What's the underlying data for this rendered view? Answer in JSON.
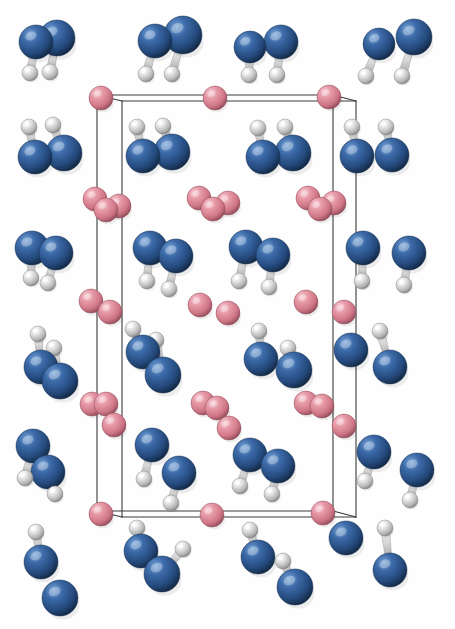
{
  "figure": {
    "kind": "crystal-structure-render",
    "background_color": "#fefefe",
    "width": 455,
    "height": 629,
    "caption": ""
  },
  "palette": {
    "atom_blue_base": "#2b5896",
    "atom_blue_light": "#5f8ec9",
    "atom_blue_dark": "#16304f",
    "atom_pink_base": "#e08795",
    "atom_pink_light": "#f4bcc5",
    "atom_pink_dark": "#9b5260",
    "atom_white_base": "#d8d8d8",
    "atom_white_light": "#ffffff",
    "atom_white_dark": "#8a8a8a",
    "bond_color": "#c9c9c9",
    "bond_edge_color": "#8d8d8d",
    "cell_edge_color": "#3a3a3a"
  },
  "legend": {
    "blue_label": "N",
    "pink_label": "O",
    "white_label": "H"
  },
  "unit_cell": {
    "label": "unit-cell",
    "stroke_width": 1.1,
    "front": {
      "x1": 122,
      "y1": 101,
      "x2": 356,
      "y2": 101,
      "x3": 356,
      "y3": 517,
      "x4": 122,
      "y4": 517
    },
    "back": {
      "x1": 97,
      "y1": 95,
      "x2": 333,
      "y2": 95,
      "x3": 333,
      "y3": 511,
      "x4": 97,
      "y4": 511
    },
    "edges": [
      [
        97,
        95,
        333,
        95
      ],
      [
        122,
        101,
        356,
        101
      ],
      [
        97,
        95,
        122,
        101
      ],
      [
        333,
        95,
        356,
        101
      ],
      [
        97,
        95,
        97,
        511
      ],
      [
        122,
        101,
        122,
        517
      ],
      [
        333,
        95,
        333,
        511
      ],
      [
        356,
        101,
        356,
        517
      ],
      [
        97,
        511,
        333,
        511
      ],
      [
        122,
        517,
        356,
        517
      ],
      [
        97,
        511,
        122,
        517
      ],
      [
        333,
        511,
        356,
        517
      ]
    ]
  },
  "atoms": [
    {
      "id": "n1",
      "type": "blue",
      "cx": 36,
      "cy": 42,
      "r": 17
    },
    {
      "id": "n2",
      "type": "blue",
      "cx": 57,
      "cy": 38,
      "r": 18
    },
    {
      "id": "h1",
      "type": "white",
      "cx": 30,
      "cy": 73,
      "r": 8
    },
    {
      "id": "h2",
      "type": "white",
      "cx": 50,
      "cy": 72,
      "r": 8
    },
    {
      "id": "n3",
      "type": "blue",
      "cx": 155,
      "cy": 41,
      "r": 17
    },
    {
      "id": "n4",
      "type": "blue",
      "cx": 183,
      "cy": 35,
      "r": 19
    },
    {
      "id": "h3",
      "type": "white",
      "cx": 146,
      "cy": 74,
      "r": 8
    },
    {
      "id": "h4",
      "type": "white",
      "cx": 172,
      "cy": 74,
      "r": 8
    },
    {
      "id": "n5",
      "type": "blue",
      "cx": 250,
      "cy": 47,
      "r": 16
    },
    {
      "id": "n6",
      "type": "blue",
      "cx": 281,
      "cy": 42,
      "r": 17
    },
    {
      "id": "h5",
      "type": "white",
      "cx": 249,
      "cy": 75,
      "r": 8
    },
    {
      "id": "h6",
      "type": "white",
      "cx": 277,
      "cy": 75,
      "r": 8
    },
    {
      "id": "n7",
      "type": "blue",
      "cx": 379,
      "cy": 44,
      "r": 16
    },
    {
      "id": "n8",
      "type": "blue",
      "cx": 414,
      "cy": 37,
      "r": 18
    },
    {
      "id": "h7",
      "type": "white",
      "cx": 366,
      "cy": 76,
      "r": 8
    },
    {
      "id": "h8",
      "type": "white",
      "cx": 402,
      "cy": 76,
      "r": 8
    },
    {
      "id": "o1",
      "type": "pink",
      "cx": 101,
      "cy": 98,
      "r": 12
    },
    {
      "id": "o2",
      "type": "pink",
      "cx": 215,
      "cy": 98,
      "r": 12
    },
    {
      "id": "o3",
      "type": "pink",
      "cx": 329,
      "cy": 97,
      "r": 12
    },
    {
      "id": "h9",
      "type": "white",
      "cx": 29,
      "cy": 127,
      "r": 8
    },
    {
      "id": "h10",
      "type": "white",
      "cx": 53,
      "cy": 125,
      "r": 8
    },
    {
      "id": "n9",
      "type": "blue",
      "cx": 35,
      "cy": 157,
      "r": 17
    },
    {
      "id": "n10",
      "type": "blue",
      "cx": 64,
      "cy": 153,
      "r": 18
    },
    {
      "id": "h11",
      "type": "white",
      "cx": 137,
      "cy": 127,
      "r": 8
    },
    {
      "id": "h12",
      "type": "white",
      "cx": 163,
      "cy": 126,
      "r": 8
    },
    {
      "id": "n11",
      "type": "blue",
      "cx": 143,
      "cy": 156,
      "r": 17
    },
    {
      "id": "n12",
      "type": "blue",
      "cx": 172,
      "cy": 152,
      "r": 18
    },
    {
      "id": "h13",
      "type": "white",
      "cx": 258,
      "cy": 128,
      "r": 8
    },
    {
      "id": "h14",
      "type": "white",
      "cx": 285,
      "cy": 127,
      "r": 8
    },
    {
      "id": "n13",
      "type": "blue",
      "cx": 263,
      "cy": 157,
      "r": 17
    },
    {
      "id": "n14",
      "type": "blue",
      "cx": 293,
      "cy": 153,
      "r": 18
    },
    {
      "id": "h15",
      "type": "white",
      "cx": 352,
      "cy": 127,
      "r": 8
    },
    {
      "id": "h16",
      "type": "white",
      "cx": 386,
      "cy": 127,
      "r": 8
    },
    {
      "id": "n15",
      "type": "blue",
      "cx": 357,
      "cy": 156,
      "r": 17
    },
    {
      "id": "n16",
      "type": "blue",
      "cx": 392,
      "cy": 155,
      "r": 17
    },
    {
      "id": "o4",
      "type": "pink",
      "cx": 95,
      "cy": 199,
      "r": 12
    },
    {
      "id": "o5",
      "type": "pink",
      "cx": 106,
      "cy": 210,
      "r": 12
    },
    {
      "id": "o6",
      "type": "pink",
      "cx": 119,
      "cy": 206,
      "r": 12
    },
    {
      "id": "o7",
      "type": "pink",
      "cx": 199,
      "cy": 198,
      "r": 12
    },
    {
      "id": "o8",
      "type": "pink",
      "cx": 213,
      "cy": 209,
      "r": 12
    },
    {
      "id": "o9",
      "type": "pink",
      "cx": 228,
      "cy": 203,
      "r": 12
    },
    {
      "id": "o10",
      "type": "pink",
      "cx": 308,
      "cy": 198,
      "r": 12
    },
    {
      "id": "o11",
      "type": "pink",
      "cx": 320,
      "cy": 209,
      "r": 12
    },
    {
      "id": "o12",
      "type": "pink",
      "cx": 334,
      "cy": 203,
      "r": 12
    },
    {
      "id": "n17",
      "type": "blue",
      "cx": 32,
      "cy": 248,
      "r": 17
    },
    {
      "id": "n18",
      "type": "blue",
      "cx": 56,
      "cy": 253,
      "r": 17
    },
    {
      "id": "h17",
      "type": "white",
      "cx": 31,
      "cy": 278,
      "r": 8
    },
    {
      "id": "h18",
      "type": "white",
      "cx": 48,
      "cy": 283,
      "r": 8
    },
    {
      "id": "n19",
      "type": "blue",
      "cx": 150,
      "cy": 248,
      "r": 17
    },
    {
      "id": "n20",
      "type": "blue",
      "cx": 176,
      "cy": 256,
      "r": 17
    },
    {
      "id": "h19",
      "type": "white",
      "cx": 147,
      "cy": 281,
      "r": 8
    },
    {
      "id": "h20",
      "type": "white",
      "cx": 169,
      "cy": 289,
      "r": 8
    },
    {
      "id": "n21",
      "type": "blue",
      "cx": 246,
      "cy": 247,
      "r": 17
    },
    {
      "id": "n22",
      "type": "blue",
      "cx": 273,
      "cy": 255,
      "r": 17
    },
    {
      "id": "h21",
      "type": "white",
      "cx": 239,
      "cy": 281,
      "r": 8
    },
    {
      "id": "h22",
      "type": "white",
      "cx": 269,
      "cy": 287,
      "r": 8
    },
    {
      "id": "n23",
      "type": "blue",
      "cx": 363,
      "cy": 248,
      "r": 17
    },
    {
      "id": "n24",
      "type": "blue",
      "cx": 409,
      "cy": 253,
      "r": 17
    },
    {
      "id": "h23",
      "type": "white",
      "cx": 362,
      "cy": 281,
      "r": 8
    },
    {
      "id": "h24",
      "type": "white",
      "cx": 404,
      "cy": 285,
      "r": 8
    },
    {
      "id": "o13",
      "type": "pink",
      "cx": 91,
      "cy": 301,
      "r": 12
    },
    {
      "id": "o14",
      "type": "pink",
      "cx": 110,
      "cy": 312,
      "r": 12
    },
    {
      "id": "o15",
      "type": "pink",
      "cx": 200,
      "cy": 305,
      "r": 12
    },
    {
      "id": "o16",
      "type": "pink",
      "cx": 228,
      "cy": 313,
      "r": 12
    },
    {
      "id": "o17",
      "type": "pink",
      "cx": 306,
      "cy": 302,
      "r": 12
    },
    {
      "id": "o18",
      "type": "pink",
      "cx": 344,
      "cy": 312,
      "r": 12
    },
    {
      "id": "h25",
      "type": "white",
      "cx": 38,
      "cy": 334,
      "r": 8
    },
    {
      "id": "h26",
      "type": "white",
      "cx": 54,
      "cy": 348,
      "r": 8
    },
    {
      "id": "n25",
      "type": "blue",
      "cx": 41,
      "cy": 367,
      "r": 17
    },
    {
      "id": "n26",
      "type": "blue",
      "cx": 60,
      "cy": 381,
      "r": 18
    },
    {
      "id": "h27",
      "type": "white",
      "cx": 133,
      "cy": 329,
      "r": 8
    },
    {
      "id": "h28",
      "type": "white",
      "cx": 156,
      "cy": 340,
      "r": 8
    },
    {
      "id": "n27",
      "type": "blue",
      "cx": 143,
      "cy": 352,
      "r": 17
    },
    {
      "id": "n28",
      "type": "blue",
      "cx": 163,
      "cy": 375,
      "r": 18
    },
    {
      "id": "h29",
      "type": "white",
      "cx": 259,
      "cy": 331,
      "r": 8
    },
    {
      "id": "h30",
      "type": "white",
      "cx": 288,
      "cy": 348,
      "r": 8
    },
    {
      "id": "n29",
      "type": "blue",
      "cx": 261,
      "cy": 359,
      "r": 17
    },
    {
      "id": "n30",
      "type": "blue",
      "cx": 294,
      "cy": 370,
      "r": 18
    },
    {
      "id": "h31",
      "type": "white",
      "cx": 380,
      "cy": 331,
      "r": 8
    },
    {
      "id": "n31",
      "type": "blue",
      "cx": 351,
      "cy": 350,
      "r": 17
    },
    {
      "id": "n32",
      "type": "blue",
      "cx": 390,
      "cy": 367,
      "r": 17
    },
    {
      "id": "o19",
      "type": "pink",
      "cx": 92,
      "cy": 404,
      "r": 12
    },
    {
      "id": "o20",
      "type": "pink",
      "cx": 106,
      "cy": 404,
      "r": 12
    },
    {
      "id": "o21",
      "type": "pink",
      "cx": 114,
      "cy": 425,
      "r": 12
    },
    {
      "id": "o22",
      "type": "pink",
      "cx": 203,
      "cy": 403,
      "r": 12
    },
    {
      "id": "o23",
      "type": "pink",
      "cx": 217,
      "cy": 408,
      "r": 12
    },
    {
      "id": "o24",
      "type": "pink",
      "cx": 229,
      "cy": 428,
      "r": 12
    },
    {
      "id": "o25",
      "type": "pink",
      "cx": 306,
      "cy": 403,
      "r": 12
    },
    {
      "id": "o26",
      "type": "pink",
      "cx": 322,
      "cy": 406,
      "r": 12
    },
    {
      "id": "o27",
      "type": "pink",
      "cx": 344,
      "cy": 426,
      "r": 12
    },
    {
      "id": "n33",
      "type": "blue",
      "cx": 33,
      "cy": 446,
      "r": 17
    },
    {
      "id": "n34",
      "type": "blue",
      "cx": 48,
      "cy": 472,
      "r": 17
    },
    {
      "id": "h32",
      "type": "white",
      "cx": 25,
      "cy": 478,
      "r": 8
    },
    {
      "id": "h33",
      "type": "white",
      "cx": 55,
      "cy": 494,
      "r": 8
    },
    {
      "id": "n35",
      "type": "blue",
      "cx": 152,
      "cy": 445,
      "r": 17
    },
    {
      "id": "n36",
      "type": "blue",
      "cx": 179,
      "cy": 473,
      "r": 17
    },
    {
      "id": "h34",
      "type": "white",
      "cx": 144,
      "cy": 479,
      "r": 8
    },
    {
      "id": "h35",
      "type": "white",
      "cx": 171,
      "cy": 503,
      "r": 8
    },
    {
      "id": "n37",
      "type": "blue",
      "cx": 250,
      "cy": 455,
      "r": 17
    },
    {
      "id": "n38",
      "type": "blue",
      "cx": 278,
      "cy": 466,
      "r": 17
    },
    {
      "id": "h36",
      "type": "white",
      "cx": 240,
      "cy": 486,
      "r": 8
    },
    {
      "id": "h37",
      "type": "white",
      "cx": 272,
      "cy": 494,
      "r": 8
    },
    {
      "id": "n39",
      "type": "blue",
      "cx": 374,
      "cy": 452,
      "r": 17
    },
    {
      "id": "n40",
      "type": "blue",
      "cx": 417,
      "cy": 470,
      "r": 17
    },
    {
      "id": "h38",
      "type": "white",
      "cx": 365,
      "cy": 481,
      "r": 8
    },
    {
      "id": "h39",
      "type": "white",
      "cx": 410,
      "cy": 500,
      "r": 8
    },
    {
      "id": "o28",
      "type": "pink",
      "cx": 101,
      "cy": 514,
      "r": 12
    },
    {
      "id": "o29",
      "type": "pink",
      "cx": 212,
      "cy": 515,
      "r": 12
    },
    {
      "id": "o30",
      "type": "pink",
      "cx": 323,
      "cy": 513,
      "r": 12
    },
    {
      "id": "h40",
      "type": "white",
      "cx": 36,
      "cy": 532,
      "r": 8
    },
    {
      "id": "h41",
      "type": "white",
      "cx": 137,
      "cy": 528,
      "r": 8
    },
    {
      "id": "h42",
      "type": "white",
      "cx": 250,
      "cy": 530,
      "r": 8
    },
    {
      "id": "h43",
      "type": "white",
      "cx": 385,
      "cy": 528,
      "r": 8
    },
    {
      "id": "n41",
      "type": "blue",
      "cx": 41,
      "cy": 562,
      "r": 17
    },
    {
      "id": "n42",
      "type": "blue",
      "cx": 60,
      "cy": 598,
      "r": 18
    },
    {
      "id": "n43",
      "type": "blue",
      "cx": 141,
      "cy": 551,
      "r": 17
    },
    {
      "id": "n44",
      "type": "blue",
      "cx": 162,
      "cy": 574,
      "r": 18
    },
    {
      "id": "n45",
      "type": "blue",
      "cx": 258,
      "cy": 557,
      "r": 17
    },
    {
      "id": "n46",
      "type": "blue",
      "cx": 295,
      "cy": 587,
      "r": 18
    },
    {
      "id": "n47",
      "type": "blue",
      "cx": 346,
      "cy": 538,
      "r": 17
    },
    {
      "id": "n48",
      "type": "blue",
      "cx": 390,
      "cy": 570,
      "r": 17
    },
    {
      "id": "h44",
      "type": "white",
      "cx": 283,
      "cy": 561,
      "r": 8
    },
    {
      "id": "h45",
      "type": "white",
      "cx": 183,
      "cy": 549,
      "r": 8
    }
  ],
  "bonds": [
    {
      "from": "n1",
      "to": "h1"
    },
    {
      "from": "n2",
      "to": "h2"
    },
    {
      "from": "n3",
      "to": "h3"
    },
    {
      "from": "n4",
      "to": "h4"
    },
    {
      "from": "n5",
      "to": "h5"
    },
    {
      "from": "n6",
      "to": "h6"
    },
    {
      "from": "n7",
      "to": "h7"
    },
    {
      "from": "n8",
      "to": "h8"
    },
    {
      "from": "n9",
      "to": "h9"
    },
    {
      "from": "n10",
      "to": "h10"
    },
    {
      "from": "n11",
      "to": "h11"
    },
    {
      "from": "n12",
      "to": "h12"
    },
    {
      "from": "n13",
      "to": "h13"
    },
    {
      "from": "n14",
      "to": "h14"
    },
    {
      "from": "n15",
      "to": "h15"
    },
    {
      "from": "n16",
      "to": "h16"
    },
    {
      "from": "n17",
      "to": "h17"
    },
    {
      "from": "n18",
      "to": "h18"
    },
    {
      "from": "n19",
      "to": "h19"
    },
    {
      "from": "n20",
      "to": "h20"
    },
    {
      "from": "n21",
      "to": "h21"
    },
    {
      "from": "n22",
      "to": "h22"
    },
    {
      "from": "n23",
      "to": "h23"
    },
    {
      "from": "n24",
      "to": "h24"
    },
    {
      "from": "n25",
      "to": "h25"
    },
    {
      "from": "n26",
      "to": "h26"
    },
    {
      "from": "n27",
      "to": "h27"
    },
    {
      "from": "n28",
      "to": "h28"
    },
    {
      "from": "n29",
      "to": "h29"
    },
    {
      "from": "n30",
      "to": "h30"
    },
    {
      "from": "n32",
      "to": "h31"
    },
    {
      "from": "n33",
      "to": "h32"
    },
    {
      "from": "n34",
      "to": "h33"
    },
    {
      "from": "n35",
      "to": "h34"
    },
    {
      "from": "n36",
      "to": "h35"
    },
    {
      "from": "n37",
      "to": "h36"
    },
    {
      "from": "n38",
      "to": "h37"
    },
    {
      "from": "n39",
      "to": "h38"
    },
    {
      "from": "n40",
      "to": "h39"
    },
    {
      "from": "n41",
      "to": "h40"
    },
    {
      "from": "n43",
      "to": "h41"
    },
    {
      "from": "n45",
      "to": "h42"
    },
    {
      "from": "n48",
      "to": "h43"
    },
    {
      "from": "n46",
      "to": "h44"
    },
    {
      "from": "n44",
      "to": "h45"
    }
  ]
}
